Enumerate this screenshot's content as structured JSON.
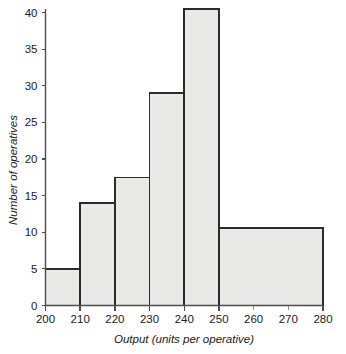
{
  "chart_data": {
    "type": "bar",
    "title": "",
    "subtitle": "",
    "xlabel": "Output (units per operative)",
    "ylabel": "Number of operatives",
    "xlim": [
      200,
      280
    ],
    "ylim": [
      0,
      40.5
    ],
    "grid": false,
    "legend": false,
    "legend_position": "none",
    "orientation": "vertical",
    "bin_edges": [
      200,
      210,
      220,
      230,
      240,
      250,
      280
    ],
    "categories": [
      "200-210",
      "210-220",
      "220-230",
      "230-240",
      "240-250",
      "250-280"
    ],
    "values": [
      5,
      14,
      17.5,
      29,
      40.5,
      10.6
    ],
    "bars": [
      {
        "label": "200-210",
        "x0": 200,
        "x1": 210,
        "height": 5
      },
      {
        "label": "210-220",
        "x0": 210,
        "x1": 220,
        "height": 14
      },
      {
        "label": "220-230",
        "x0": 220,
        "x1": 230,
        "height": 17.5
      },
      {
        "label": "230-240",
        "x0": 230,
        "x1": 240,
        "height": 29
      },
      {
        "label": "240-250",
        "x0": 240,
        "x1": 250,
        "height": 40.5
      },
      {
        "label": "250-280",
        "x0": 250,
        "x1": 280,
        "height": 10.6
      }
    ],
    "x_ticks_major": [
      200,
      210,
      220,
      230,
      240,
      250,
      280
    ],
    "x_ticks_minor": [
      260,
      270
    ],
    "x_tick_labels": [
      "200",
      "210",
      "220",
      "230",
      "240",
      "250",
      "260",
      "270",
      "280"
    ],
    "x_tick_values": [
      200,
      210,
      220,
      230,
      240,
      250,
      260,
      270,
      280
    ],
    "y_ticks": [
      0,
      5,
      10,
      15,
      20,
      25,
      30,
      35,
      40
    ],
    "y_tick_labels": [
      "0",
      "5",
      "10",
      "15",
      "20",
      "25",
      "30",
      "35",
      "40"
    ],
    "colors": {
      "bar_fill": "#e9e9e7",
      "bar_edge": "#2b2b2b",
      "axis": "#4d4d4d",
      "text": "#1a1a1a",
      "background": "#ffffff"
    }
  }
}
